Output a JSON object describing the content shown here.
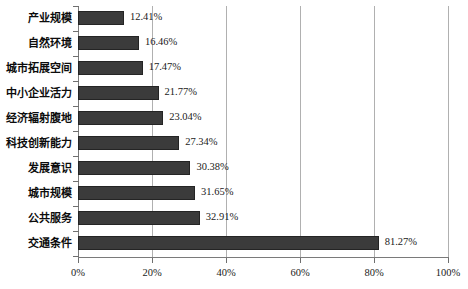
{
  "chart_data": {
    "type": "bar",
    "orientation": "horizontal",
    "title": "",
    "xlabel": "",
    "ylabel": "",
    "xlim": [
      0,
      100
    ],
    "grid": true,
    "legend": false,
    "categories": [
      "产业规模",
      "自然环境",
      "城市拓展空间",
      "中小企业活力",
      "经济辐射腹地",
      "科技创新能力",
      "发展意识",
      "城市规模",
      "公共服务",
      "交通条件"
    ],
    "values": [
      12.41,
      16.46,
      17.47,
      21.77,
      23.04,
      27.34,
      30.38,
      31.65,
      32.91,
      81.27
    ],
    "value_labels": [
      "12.41%",
      "16.46%",
      "17.47%",
      "21.77%",
      "23.04%",
      "27.34%",
      "30.38%",
      "31.65%",
      "32.91%",
      "81.27%"
    ],
    "xticks": [
      0,
      20,
      40,
      60,
      80,
      100
    ],
    "xtick_labels": [
      "0%",
      "20%",
      "40%",
      "60%",
      "80%",
      "100%"
    ],
    "bar_color": "#3b3b3b",
    "bar_border_color": "#242424",
    "gridline_color": "#b0b0b0",
    "axis_color": "#7a7a7a",
    "background_color": "#ffffff"
  }
}
